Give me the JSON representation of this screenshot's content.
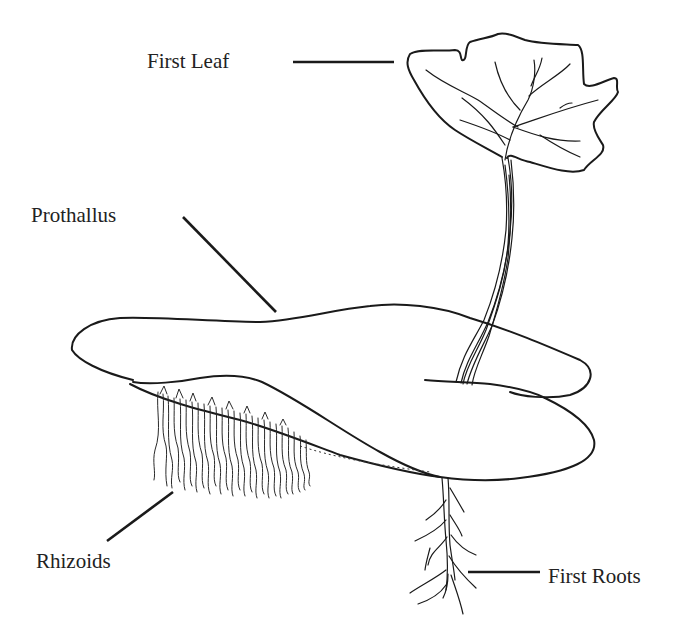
{
  "diagram": {
    "labels": [
      {
        "id": "first-leaf",
        "text": "First Leaf"
      },
      {
        "id": "prothallus",
        "text": "Prothallus"
      },
      {
        "id": "rhizoids",
        "text": "Rhizoids"
      },
      {
        "id": "first-roots",
        "text": "First Roots"
      }
    ],
    "colors": {
      "background": "#ffffff",
      "ink": "#1a1a1a",
      "text": "#222222"
    }
  }
}
